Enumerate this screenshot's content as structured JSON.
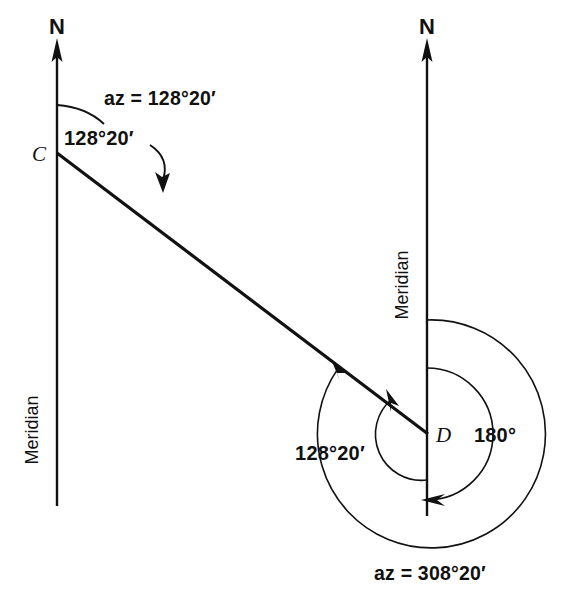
{
  "figure": {
    "type": "surveying-azimuth-diagram",
    "background_color": "#ffffff",
    "line_color": "#111111",
    "width": 574,
    "height": 600
  },
  "stations": [
    {
      "id": "C",
      "label": "C",
      "x": 57,
      "y": 153,
      "meridian_label": "Meridian",
      "north_label": "N",
      "meridian_top_y": 47,
      "meridian_bottom_y": 506
    },
    {
      "id": "D",
      "label": "D",
      "x": 428,
      "y": 434,
      "meridian_label": "Meridian",
      "north_label": "N",
      "meridian_top_y": 47,
      "meridian_bottom_y": 516
    }
  ],
  "line_cd": {
    "from": "C",
    "to": "D",
    "x1": 57,
    "y1": 153,
    "x2": 428,
    "y2": 434
  },
  "labels": {
    "north_left": "N",
    "north_right": "N",
    "point_c": "C",
    "point_d": "D",
    "meridian_left": "Meridian",
    "meridian_right": "Meridian",
    "az_forward": "az = 128°20′",
    "angle_forward": "128°20′",
    "angle_back_interior": "128°20′",
    "angle_180": "180°",
    "az_back": "az = 308°20′"
  },
  "angles": {
    "forward_azimuth_deg": 128,
    "forward_azimuth_min": 20,
    "forward_azimuth_text": "128°20′",
    "back_azimuth_deg": 308,
    "back_azimuth_min": 20,
    "back_azimuth_text": "308°20′",
    "straight_angle_text": "180°",
    "straight_angle_deg": 180
  },
  "arcs": {
    "outer_back_azimuth_radius": 114,
    "inner_180_radius": 66,
    "inner_128_radius": 46
  }
}
